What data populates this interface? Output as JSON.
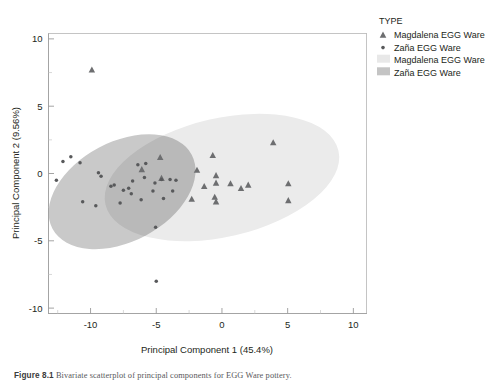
{
  "figure": {
    "caption_label": "Figure 8.1",
    "caption_text": "Bivariate scatterplot of principal components for EGG Ware pottery."
  },
  "legend": {
    "title": "TYPE",
    "items": [
      {
        "label": "Magdalena EGG Ware",
        "marker": "triangle-marker",
        "color": "#6d6e70"
      },
      {
        "label": "Zaña EGG Ware",
        "marker": "dot-marker",
        "color": "#58595b"
      },
      {
        "label": "Magdalena EGG Ware",
        "marker": "swatch",
        "color": "#e8e8e8"
      },
      {
        "label": "Zaña EGG Ware",
        "marker": "swatch",
        "color": "#c4c4c4"
      }
    ]
  },
  "chart_data": {
    "type": "scatter",
    "title": "",
    "xlabel": "Principal Component 1 (45.4%)",
    "ylabel": "Principal Component 2 (9.56%)",
    "xlim": [
      -13.2,
      11.0
    ],
    "ylim": [
      -10.4,
      10.4
    ],
    "xticks": [
      -10,
      -5,
      0,
      5,
      10
    ],
    "yticks": [
      -10,
      -5,
      0,
      5,
      10
    ],
    "xminorticks": [
      -12.5,
      -7.5,
      -2.5,
      2.5,
      7.5
    ],
    "yminorticks": [
      -7.5,
      -2.5,
      2.5,
      7.5
    ],
    "grid": false,
    "legend_position": "right",
    "series": [
      {
        "name": "Magdalena EGG Ware",
        "marker": "triangle",
        "color": "#6d6e70",
        "points": [
          [
            -9.9,
            7.7
          ],
          [
            -4.7,
            1.2
          ],
          [
            -6.1,
            0.3
          ],
          [
            -4.6,
            -0.35
          ],
          [
            -0.7,
            1.35
          ],
          [
            3.9,
            2.3
          ],
          [
            -1.9,
            0.25
          ],
          [
            -0.45,
            -0.15
          ],
          [
            -0.45,
            -0.7
          ],
          [
            0.65,
            -0.75
          ],
          [
            1.45,
            -1.1
          ],
          [
            2.0,
            -0.85
          ],
          [
            -2.3,
            -1.9
          ],
          [
            -0.55,
            -1.75
          ],
          [
            -0.45,
            -2.1
          ],
          [
            5.05,
            -0.75
          ],
          [
            5.05,
            -2.0
          ],
          [
            -1.35,
            -0.95
          ]
        ]
      },
      {
        "name": "Zaña EGG Ware",
        "marker": "dot",
        "color": "#58595b",
        "points": [
          [
            -11.5,
            1.25
          ],
          [
            -12.1,
            0.9
          ],
          [
            -10.8,
            0.8
          ],
          [
            -6.4,
            0.65
          ],
          [
            -5.8,
            0.75
          ],
          [
            -9.4,
            0.05
          ],
          [
            -9.2,
            -0.2
          ],
          [
            -5.9,
            -0.3
          ],
          [
            -6.8,
            -0.55
          ],
          [
            -12.6,
            -0.5
          ],
          [
            -8.2,
            -0.85
          ],
          [
            -7.1,
            -1.1
          ],
          [
            -7.5,
            -1.25
          ],
          [
            -6.9,
            -1.5
          ],
          [
            -5.1,
            -0.7
          ],
          [
            -4.6,
            -0.45
          ],
          [
            -3.95,
            -0.45
          ],
          [
            -3.5,
            -0.5
          ],
          [
            -5.25,
            -1.3
          ],
          [
            -10.6,
            -2.1
          ],
          [
            -9.6,
            -2.4
          ],
          [
            -7.75,
            -2.2
          ],
          [
            -6.15,
            -1.95
          ],
          [
            -4.45,
            -1.85
          ],
          [
            -3.75,
            -1.3
          ],
          [
            -8.45,
            -0.95
          ],
          [
            -5.05,
            -4.0
          ],
          [
            -5.0,
            -8.0
          ]
        ]
      }
    ],
    "ellipses": [
      {
        "name": "Magdalena EGG Ware",
        "fill": "#ebebeb",
        "cx": 0.0,
        "cy": -0.3,
        "rx": 9.1,
        "ry": 4.4,
        "rotation": -13
      },
      {
        "name": "Zaña EGG Ware",
        "fill": "#c9c9c9",
        "cx": -7.6,
        "cy": -1.35,
        "rx": 6.0,
        "ry": 3.7,
        "rotation": -28
      }
    ]
  }
}
